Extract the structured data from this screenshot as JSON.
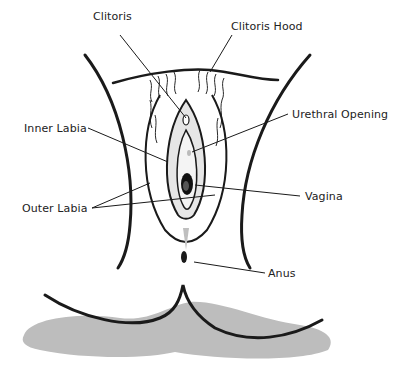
{
  "diagram": {
    "type": "anatomical-illustration",
    "labels": [
      {
        "id": "clitoris",
        "text": "Clitoris",
        "x": 93,
        "y": 16
      },
      {
        "id": "clitoris-hood",
        "text": "Clitoris Hood",
        "x": 231,
        "y": 17
      },
      {
        "id": "urethral-opening",
        "text": "Urethral Opening",
        "x": 292,
        "y": 110
      },
      {
        "id": "inner-labia",
        "text": "Inner Labia",
        "x": 24,
        "y": 122
      },
      {
        "id": "vagina",
        "text": "Vagina",
        "x": 305,
        "y": 190
      },
      {
        "id": "outer-labia",
        "text": "Outer Labia",
        "x": 22,
        "y": 202
      },
      {
        "id": "anus",
        "text": "Anus",
        "x": 268,
        "y": 267
      }
    ]
  },
  "colors": {
    "line": "#1a1a1a",
    "shadow": "#bdbdbd",
    "shade": "#d4d4d4",
    "background": "#ffffff",
    "label_text": "#222222"
  }
}
